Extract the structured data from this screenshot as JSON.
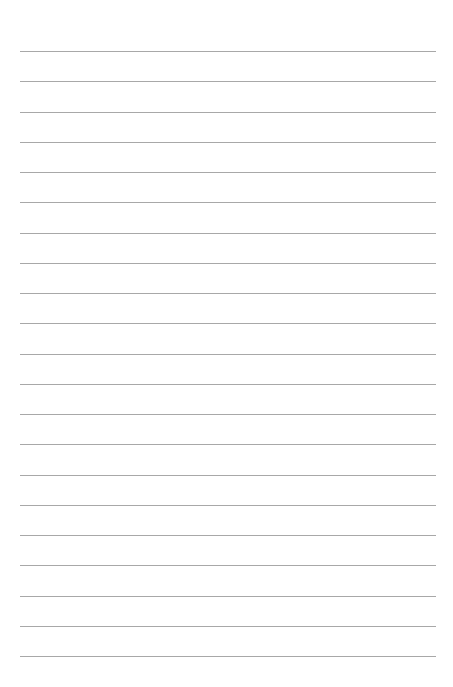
{
  "page": {
    "type": "lined-paper",
    "background_color": "#ffffff",
    "line_color": "#a8a8a8",
    "line_count": 21,
    "first_line_y": 51,
    "line_spacing": 30.25,
    "line_left": 20,
    "line_width": 416
  }
}
